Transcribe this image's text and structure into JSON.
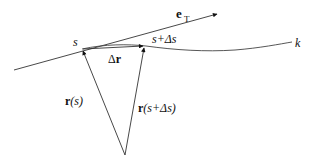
{
  "diagram": {
    "type": "tangent-vector-derivation",
    "labels": {
      "tangent_vector": "e",
      "tangent_subscript": "T",
      "point_s": "s",
      "point_s_ds": "s+Δs",
      "delta_r": "Δr",
      "r_s_bold": "r",
      "r_s_arg": "(s)",
      "r_sds_bold": "r",
      "r_sds_arg": "(s+Δs)",
      "curve_name": "k"
    },
    "points": {
      "origin": [
        125,
        155
      ],
      "s": [
        82,
        49
      ],
      "s_plus_ds": [
        144,
        46
      ],
      "tangent_start": [
        14,
        70
      ],
      "tangent_end": [
        218,
        14
      ],
      "curve_end": [
        296,
        42
      ]
    },
    "colors": {
      "stroke": "#333333",
      "text": "#111111",
      "background": "#ffffff"
    }
  }
}
